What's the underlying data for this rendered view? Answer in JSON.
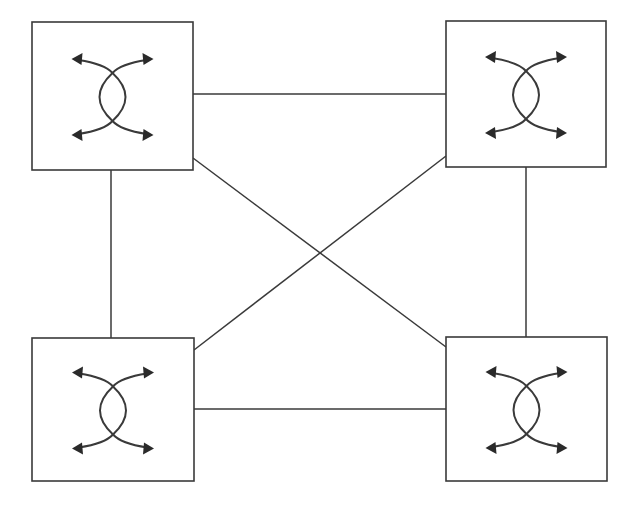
{
  "diagram": {
    "type": "full-mesh network of 4 switching nodes",
    "colors": {
      "stroke": "#3a3a3a",
      "background": "#ffffff",
      "arrow": "#2a2a2a"
    },
    "nodes": [
      {
        "id": "top-left",
        "icon": "crossover-switch-icon",
        "x": 32,
        "y": 22,
        "w": 161,
        "h": 148
      },
      {
        "id": "top-right",
        "icon": "crossover-switch-icon",
        "x": 446,
        "y": 21,
        "w": 160,
        "h": 146
      },
      {
        "id": "bottom-left",
        "icon": "crossover-switch-icon",
        "x": 32,
        "y": 338,
        "w": 162,
        "h": 143
      },
      {
        "id": "bottom-right",
        "icon": "crossover-switch-icon",
        "x": 446,
        "y": 337,
        "w": 161,
        "h": 144
      }
    ],
    "links": [
      {
        "from": "top-left",
        "to": "top-right",
        "x1": 193,
        "y1": 94,
        "x2": 446,
        "y2": 94
      },
      {
        "from": "bottom-left",
        "to": "bottom-right",
        "x1": 194,
        "y1": 409,
        "x2": 446,
        "y2": 409
      },
      {
        "from": "top-left",
        "to": "bottom-left",
        "x1": 111,
        "y1": 170,
        "x2": 111,
        "y2": 338
      },
      {
        "from": "top-right",
        "to": "bottom-right",
        "x1": 526,
        "y1": 167,
        "x2": 526,
        "y2": 337
      },
      {
        "from": "top-left",
        "to": "bottom-right",
        "x1": 193,
        "y1": 158,
        "x2": 446,
        "y2": 347
      },
      {
        "from": "top-right",
        "to": "bottom-left",
        "x1": 446,
        "y1": 156,
        "x2": 194,
        "y2": 350
      }
    ]
  }
}
